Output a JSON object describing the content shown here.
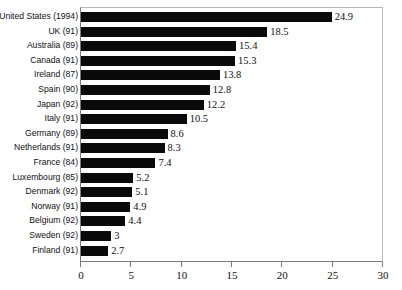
{
  "chart_data": {
    "type": "bar",
    "orientation": "horizontal",
    "title": "",
    "xlabel": "",
    "ylabel": "",
    "xlim": [
      0,
      30
    ],
    "xticks": [
      0,
      5,
      10,
      15,
      20,
      25,
      30
    ],
    "xtick_labels": [
      "0",
      "5",
      "10",
      "15",
      "20",
      "25",
      "30"
    ],
    "grid": false,
    "legend": false,
    "bar_color": "#0a0a0a",
    "axis_color": "#7a7a7a",
    "categories": [
      "United States (1994)",
      "UK (91)",
      "Australia (89)",
      "Canada (91)",
      "Ireland (87)",
      "Spain (90)",
      "Japan (92)",
      "Italy (91)",
      "Germany (89)",
      "Netherlands (91)",
      "France (84)",
      "Luxembourg (85)",
      "Denmark (92)",
      "Norway (91)",
      "Belgium (92)",
      "Sweden (92)",
      "Finland (91)"
    ],
    "values": [
      24.9,
      18.5,
      15.4,
      15.3,
      13.8,
      12.8,
      12.2,
      10.5,
      8.6,
      8.3,
      7.4,
      5.2,
      5.1,
      4.9,
      4.4,
      3,
      2.7
    ],
    "value_labels": [
      "24.9",
      "18.5",
      "15.4",
      "15.3",
      "13.8",
      "12.8",
      "12.2",
      "10.5",
      "8.6",
      "8.3",
      "7.4",
      "5.2",
      "5.1",
      "4.9",
      "4.4",
      "3",
      "2.7"
    ],
    "bars": [
      {
        "category": "United States (1994)",
        "value": 24.9,
        "label": "24.9"
      },
      {
        "category": "UK (91)",
        "value": 18.5,
        "label": "18.5"
      },
      {
        "category": "Australia (89)",
        "value": 15.4,
        "label": "15.4"
      },
      {
        "category": "Canada (91)",
        "value": 15.3,
        "label": "15.3"
      },
      {
        "category": "Ireland (87)",
        "value": 13.8,
        "label": "13.8"
      },
      {
        "category": "Spain (90)",
        "value": 12.8,
        "label": "12.8"
      },
      {
        "category": "Japan (92)",
        "value": 12.2,
        "label": "12.2"
      },
      {
        "category": "Italy (91)",
        "value": 10.5,
        "label": "10.5"
      },
      {
        "category": "Germany (89)",
        "value": 8.6,
        "label": "8.6"
      },
      {
        "category": "Netherlands (91)",
        "value": 8.3,
        "label": "8.3"
      },
      {
        "category": "France (84)",
        "value": 7.4,
        "label": "7.4"
      },
      {
        "category": "Luxembourg (85)",
        "value": 5.2,
        "label": "5.2"
      },
      {
        "category": "Denmark (92)",
        "value": 5.1,
        "label": "5.1"
      },
      {
        "category": "Norway (91)",
        "value": 4.9,
        "label": "4.9"
      },
      {
        "category": "Belgium (92)",
        "value": 4.4,
        "label": "4.4"
      },
      {
        "category": "Sweden (92)",
        "value": 3,
        "label": "3"
      },
      {
        "category": "Finland (91)",
        "value": 2.7,
        "label": "2.7"
      }
    ]
  }
}
